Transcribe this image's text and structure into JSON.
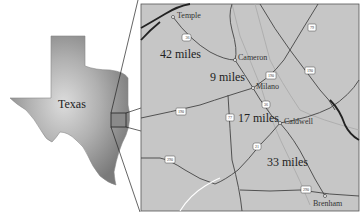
{
  "state_map": {
    "label": "Texas",
    "fill_color": "#9a9a9a",
    "highlight_color": "#c8c8c8"
  },
  "detail_map": {
    "background": "#c4c4c4",
    "cities": [
      {
        "name": "Temple",
        "x": 173,
        "y": 17
      },
      {
        "name": "Cameron",
        "x": 235,
        "y": 60
      },
      {
        "name": "Milano",
        "x": 253,
        "y": 88
      },
      {
        "name": "Caldwell",
        "x": 280,
        "y": 123
      },
      {
        "name": "Brenham",
        "x": 325,
        "y": 196
      }
    ],
    "distances": [
      {
        "label": "42 miles",
        "x": 187,
        "y": 58
      },
      {
        "label": "9 miles",
        "x": 210,
        "y": 82
      },
      {
        "label": "17 miles",
        "x": 238,
        "y": 122
      },
      {
        "label": "33 miles",
        "x": 267,
        "y": 166
      }
    ],
    "highway_shields": [
      {
        "number": "36",
        "x": 187,
        "y": 38
      },
      {
        "number": "190",
        "x": 271,
        "y": 76
      },
      {
        "number": "36",
        "x": 266,
        "y": 105
      },
      {
        "number": "190",
        "x": 181,
        "y": 112
      },
      {
        "number": "77",
        "x": 230,
        "y": 118
      },
      {
        "number": "21",
        "x": 257,
        "y": 147
      },
      {
        "number": "290",
        "x": 170,
        "y": 160
      },
      {
        "number": "290",
        "x": 306,
        "y": 190
      },
      {
        "number": "79",
        "x": 312,
        "y": 28
      },
      {
        "number": "190",
        "x": 310,
        "y": 71
      }
    ]
  }
}
